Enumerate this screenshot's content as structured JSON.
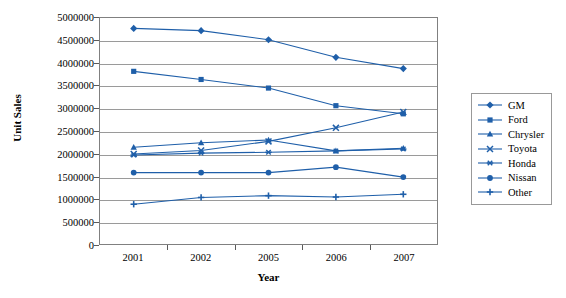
{
  "chart_data": {
    "type": "line",
    "title": "",
    "xlabel": "Year",
    "ylabel": "Unit Sales",
    "categories": [
      "2001",
      "2002",
      "2005",
      "2006",
      "2007"
    ],
    "ylim": [
      0,
      5000000
    ],
    "ytick_labels": [
      "0",
      "500000",
      "1000000",
      "1500000",
      "2000000",
      "2500000",
      "3000000",
      "3500000",
      "4000000",
      "4500000",
      "5000000"
    ],
    "ytick_values": [
      0,
      500000,
      1000000,
      1500000,
      2000000,
      2500000,
      3000000,
      3500000,
      4000000,
      4500000,
      5000000
    ],
    "grid": true,
    "legend_position": "right",
    "series": [
      {
        "name": "GM",
        "marker": "diamond",
        "color": "#1F5FA9",
        "values": [
          4770000,
          4720000,
          4520000,
          4130000,
          3880000
        ]
      },
      {
        "name": "Ford",
        "marker": "square",
        "color": "#1F5FA9",
        "values": [
          3820000,
          3640000,
          3450000,
          3060000,
          2880000
        ]
      },
      {
        "name": "Chrysler",
        "marker": "triangle",
        "color": "#1F5FA9",
        "values": [
          2140000,
          2240000,
          2300000,
          2060000,
          2120000
        ]
      },
      {
        "name": "Toyota",
        "marker": "x",
        "color": "#1F5FA9",
        "values": [
          1990000,
          2070000,
          2270000,
          2570000,
          2920000
        ]
      },
      {
        "name": "Honda",
        "marker": "star",
        "color": "#1F5FA9",
        "values": [
          1970000,
          2010000,
          2030000,
          2060000,
          2100000
        ]
      },
      {
        "name": "Nissan",
        "marker": "circle",
        "color": "#1F5FA9",
        "values": [
          1580000,
          1580000,
          1580000,
          1700000,
          1480000
        ]
      },
      {
        "name": "Other",
        "marker": "plus",
        "color": "#1F5FA9",
        "values": [
          880000,
          1030000,
          1070000,
          1040000,
          1100000
        ]
      }
    ]
  },
  "colors": {
    "series": "#1F5FA9",
    "gridline": "#9a9a9a",
    "border": "#808080",
    "text": "#000000"
  }
}
